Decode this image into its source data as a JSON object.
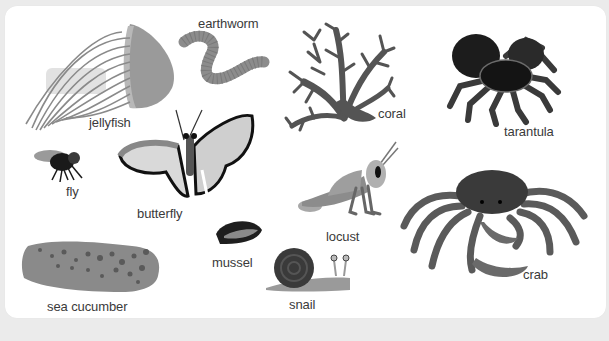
{
  "figure": {
    "items": [
      {
        "id": "jellyfish",
        "label": "jellyfish"
      },
      {
        "id": "earthworm",
        "label": "earthworm"
      },
      {
        "id": "coral",
        "label": "coral"
      },
      {
        "id": "tarantula",
        "label": "tarantula"
      },
      {
        "id": "fly",
        "label": "fly"
      },
      {
        "id": "butterfly",
        "label": "butterfly"
      },
      {
        "id": "locust",
        "label": "locust"
      },
      {
        "id": "crab",
        "label": "crab"
      },
      {
        "id": "mussel",
        "label": "mussel"
      },
      {
        "id": "snail",
        "label": "snail"
      },
      {
        "id": "sea-cucumber",
        "label": "sea cucumber"
      }
    ]
  },
  "colors": {
    "background": "#ebebeb",
    "card": "#ffffff",
    "label_text": "#3a3a3a"
  }
}
